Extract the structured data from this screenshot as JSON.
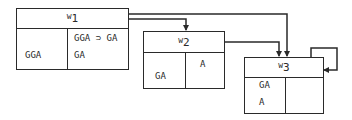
{
  "diagram": {
    "type": "kripke-frame",
    "worlds": [
      {
        "id": "w1",
        "label_prefix": "w",
        "label_index": "1",
        "left_cell": [
          "GGA"
        ],
        "right_cell": [
          "GGA ⊃ GA",
          "GA"
        ]
      },
      {
        "id": "w2",
        "label_prefix": "w",
        "label_index": "2",
        "left_cell": [
          "GA"
        ],
        "right_cell": [
          "A"
        ]
      },
      {
        "id": "w3",
        "label_prefix": "w",
        "label_index": "3",
        "left_cell": [
          "GA",
          "A"
        ],
        "right_cell": []
      }
    ],
    "edges": [
      {
        "from": "w1",
        "to": "w2"
      },
      {
        "from": "w1",
        "to": "w3"
      },
      {
        "from": "w2",
        "to": "w3"
      },
      {
        "from": "w3",
        "to": "w3"
      }
    ],
    "colors": {
      "stroke": "#2a2a2a",
      "background": "#ffffff"
    }
  }
}
